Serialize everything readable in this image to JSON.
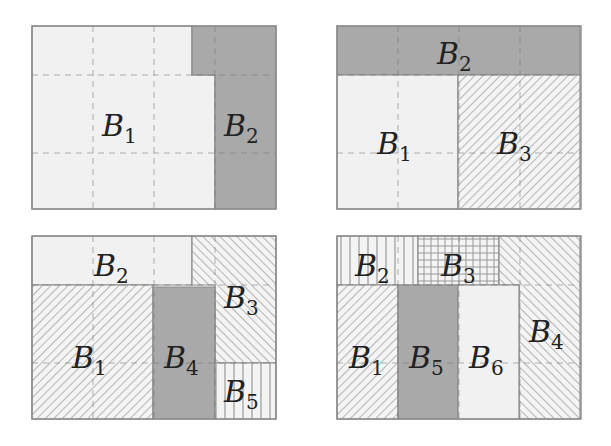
{
  "colors": {
    "light": "#f1f1f1",
    "dark": "#a9a9a9",
    "border": "#8a8a8a",
    "hatch": "#9a9a9a",
    "grid_dash": "#777777",
    "text": "#222222"
  },
  "panels": [
    {
      "id": "top-left",
      "origin": [
        32,
        26
      ],
      "regions": [
        {
          "name": "B1",
          "label": "𝓑",
          "sub": "1",
          "fill": "light",
          "pts": [
            [
              0,
              0
            ],
            [
              160,
              0
            ],
            [
              160,
              49
            ],
            [
              183,
              49
            ],
            [
              183,
              183
            ],
            [
              0,
              183
            ]
          ],
          "lx": 70,
          "ly": 110
        },
        {
          "name": "B2",
          "label": "𝓑",
          "sub": "2",
          "fill": "dark",
          "pts": [
            [
              160,
              0
            ],
            [
              244,
              0
            ],
            [
              244,
              183
            ],
            [
              183,
              183
            ],
            [
              183,
              49
            ],
            [
              160,
              49
            ]
          ],
          "lx": 192,
          "ly": 110
        }
      ]
    },
    {
      "id": "top-right",
      "origin": [
        337,
        26
      ],
      "regions": [
        {
          "name": "B2",
          "label": "𝓑",
          "sub": "2",
          "fill": "dark",
          "pts": [
            [
              0,
              0
            ],
            [
              243,
              0
            ],
            [
              243,
              49
            ],
            [
              0,
              49
            ]
          ],
          "lx": 100,
          "ly": 38
        },
        {
          "name": "B1",
          "label": "𝓑",
          "sub": "1",
          "fill": "light",
          "pts": [
            [
              0,
              49
            ],
            [
              121,
              49
            ],
            [
              121,
              183
            ],
            [
              0,
              183
            ]
          ],
          "lx": 40,
          "ly": 128
        },
        {
          "name": "B3",
          "label": "𝓑",
          "sub": "3",
          "fill": "hatch-fwd",
          "pts": [
            [
              121,
              49
            ],
            [
              243,
              49
            ],
            [
              243,
              183
            ],
            [
              121,
              183
            ]
          ],
          "lx": 160,
          "ly": 128
        }
      ]
    },
    {
      "id": "bottom-left",
      "origin": [
        32,
        236
      ],
      "regions": [
        {
          "name": "B2",
          "label": "𝓑",
          "sub": "2",
          "fill": "light",
          "pts": [
            [
              0,
              0
            ],
            [
              160,
              0
            ],
            [
              160,
              49
            ],
            [
              0,
              49
            ]
          ],
          "lx": 62,
          "ly": 40
        },
        {
          "name": "B3",
          "label": "𝓑",
          "sub": "3",
          "fill": "hatch-back",
          "pts": [
            [
              160,
              0
            ],
            [
              244,
              0
            ],
            [
              244,
              127
            ],
            [
              183,
              127
            ],
            [
              183,
              49
            ],
            [
              160,
              49
            ]
          ],
          "lx": 192,
          "ly": 72
        },
        {
          "name": "B1",
          "label": "𝓑",
          "sub": "1",
          "fill": "hatch-fwd",
          "pts": [
            [
              0,
              49
            ],
            [
              121,
              49
            ],
            [
              121,
              183
            ],
            [
              0,
              183
            ]
          ],
          "lx": 40,
          "ly": 132
        },
        {
          "name": "B4",
          "label": "𝓑",
          "sub": "4",
          "fill": "dark",
          "pts": [
            [
              121,
              51
            ],
            [
              183,
              51
            ],
            [
              183,
              183
            ],
            [
              121,
              183
            ]
          ],
          "lx": 132,
          "ly": 132
        },
        {
          "name": "B5",
          "label": "𝓑",
          "sub": "5",
          "fill": "vlines",
          "pts": [
            [
              183,
              127
            ],
            [
              244,
              127
            ],
            [
              244,
              183
            ],
            [
              183,
              183
            ]
          ],
          "lx": 192,
          "ly": 166
        }
      ]
    },
    {
      "id": "bottom-right",
      "origin": [
        337,
        236
      ],
      "regions": [
        {
          "name": "B2",
          "label": "𝓑",
          "sub": "2",
          "fill": "vlines",
          "pts": [
            [
              0,
              0
            ],
            [
              81,
              0
            ],
            [
              81,
              49
            ],
            [
              0,
              49
            ]
          ],
          "lx": 18,
          "ly": 40
        },
        {
          "name": "B3",
          "label": "𝓑",
          "sub": "3",
          "fill": "grid",
          "pts": [
            [
              81,
              0
            ],
            [
              162,
              0
            ],
            [
              162,
              49
            ],
            [
              81,
              49
            ]
          ],
          "lx": 104,
          "ly": 40
        },
        {
          "name": "B4",
          "label": "𝓑",
          "sub": "4",
          "fill": "hatch-back",
          "pts": [
            [
              162,
              0
            ],
            [
              243,
              0
            ],
            [
              243,
              183
            ],
            [
              182,
              183
            ],
            [
              182,
              49
            ],
            [
              162,
              49
            ]
          ],
          "lx": 192,
          "ly": 106
        },
        {
          "name": "B1",
          "label": "𝓑",
          "sub": "1",
          "fill": "hatch-fwd",
          "pts": [
            [
              0,
              49
            ],
            [
              61,
              49
            ],
            [
              61,
              183
            ],
            [
              0,
              183
            ]
          ],
          "lx": 12,
          "ly": 132
        },
        {
          "name": "B5",
          "label": "𝓑",
          "sub": "5",
          "fill": "dark",
          "pts": [
            [
              61,
              49
            ],
            [
              121,
              49
            ],
            [
              121,
              183
            ],
            [
              61,
              183
            ]
          ],
          "lx": 72,
          "ly": 132
        },
        {
          "name": "B6",
          "label": "𝓑",
          "sub": "6",
          "fill": "light",
          "pts": [
            [
              121,
              49
            ],
            [
              182,
              49
            ],
            [
              182,
              183
            ],
            [
              121,
              183
            ]
          ],
          "lx": 132,
          "ly": 132
        }
      ]
    }
  ],
  "grid": {
    "outer_size": [
      244,
      183
    ],
    "col_xs": [
      61,
      122,
      183
    ],
    "row_ys": [
      49,
      127
    ]
  }
}
